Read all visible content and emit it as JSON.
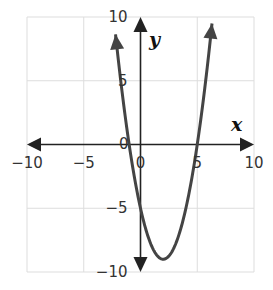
{
  "chart_data": {
    "type": "line",
    "title": "",
    "function": "y = x^2 - 4x - 5",
    "xlabel": "x",
    "ylabel": "y",
    "xlim": [
      -10,
      10
    ],
    "ylim": [
      -10,
      10
    ],
    "grid": true,
    "grid_step": 5,
    "x_ticks": [
      "-10",
      "-5",
      "0",
      "5",
      "10"
    ],
    "y_ticks": [
      "10",
      "5",
      "0",
      "-5",
      "-10"
    ],
    "series": [
      {
        "name": "parabola",
        "x": [
          -2.2,
          -2,
          -1,
          0,
          1,
          2,
          3,
          4,
          5,
          6,
          6.3
        ],
        "y": [
          8.64,
          7,
          0,
          -5,
          -8,
          -9,
          -8,
          -5,
          0,
          7,
          9.49
        ]
      }
    ],
    "features": {
      "vertex": [
        2,
        -9
      ],
      "x_intercepts": [
        -1,
        5
      ],
      "y_intercept": -5
    },
    "arrows_on_ends": true,
    "colors": {
      "curve": "#444444",
      "axes": "#222222",
      "grid": "#dddddd"
    }
  }
}
